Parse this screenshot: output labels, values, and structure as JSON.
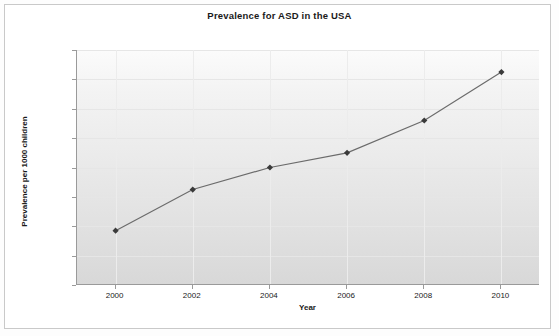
{
  "chart_data": {
    "type": "line",
    "title": "Prevalence for ASD in the USA",
    "xlabel": "Year",
    "ylabel": "Prevalence per 1000 children",
    "x": [
      2000,
      2002,
      2004,
      2006,
      2008,
      2010
    ],
    "categories": [
      "2000",
      "2002",
      "2004",
      "2006",
      "2008",
      "2010"
    ],
    "values": [
      3.7,
      6.5,
      8.0,
      9.0,
      11.2,
      14.5
    ],
    "series": [
      {
        "name": "Prevalence per 1000 children",
        "values": [
          3.7,
          6.5,
          8.0,
          9.0,
          11.2,
          14.5
        ]
      }
    ],
    "xlim": [
      1999,
      2011
    ],
    "ylim": [
      0,
      16
    ],
    "ytick_labels": [
      "0",
      "2",
      "4",
      "6",
      "8",
      "10",
      "12",
      "14",
      "16"
    ],
    "ytick_values": [
      0,
      2,
      4,
      6,
      8,
      10,
      12,
      14,
      16
    ],
    "xtick_labels": [
      "2000",
      "2002",
      "2004",
      "2006",
      "2008",
      "2010"
    ],
    "grid": true,
    "legend": false,
    "marker": "diamond",
    "line_color": "#6b6b6b",
    "marker_color": "#3a3a3a",
    "plot_bg_top": "#fbfbfb",
    "plot_bg_bottom": "#d8d8d8"
  }
}
